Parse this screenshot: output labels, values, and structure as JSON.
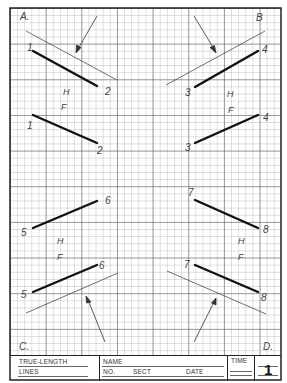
{
  "sheet": {
    "corners": {
      "a": "A.",
      "b": "B",
      "c": "C.",
      "d": "D."
    },
    "views": [
      {
        "id": "top-left-H",
        "label": "H",
        "points": [
          "1",
          "2"
        ]
      },
      {
        "id": "top-left-F",
        "label": "F",
        "points": [
          "1",
          "2"
        ]
      },
      {
        "id": "top-right-H",
        "label": "H",
        "points": [
          "3",
          "4"
        ]
      },
      {
        "id": "top-right-F",
        "label": "F",
        "points": [
          "3",
          "4"
        ]
      },
      {
        "id": "bottom-left-F",
        "label": "F",
        "points": [
          "5",
          "6"
        ]
      },
      {
        "id": "bottom-left-H",
        "label": "H",
        "points": [
          "5",
          "6"
        ]
      },
      {
        "id": "bottom-right-F",
        "label": "F",
        "points": [
          "7",
          "8"
        ]
      },
      {
        "id": "bottom-right-H",
        "label": "H",
        "points": [
          "7",
          "8"
        ]
      }
    ],
    "labels": {
      "p1a": "1",
      "p2a": "2",
      "h1": "H",
      "f1": "F",
      "p1b": "1",
      "p2b": "2",
      "p3a": "3",
      "p4a": "4",
      "h2": "H",
      "f2": "F",
      "p3b": "3",
      "p4b": "4",
      "p5a": "5",
      "p6a": "6",
      "h3": "H",
      "f3": "F",
      "p5b": "5",
      "p6b": "6",
      "p7a": "7",
      "p8a": "8",
      "h4": "H",
      "f4": "F",
      "p7b": "7",
      "p8b": "8"
    }
  },
  "title_block": {
    "title_line1": "TRUE-LENGTH",
    "title_line2": "LINES",
    "name_label": "NAME",
    "no_label": "NO.",
    "sect_label": "SECT",
    "date_label": "DATE",
    "time_label": "TIME",
    "sheet_number": "1"
  }
}
